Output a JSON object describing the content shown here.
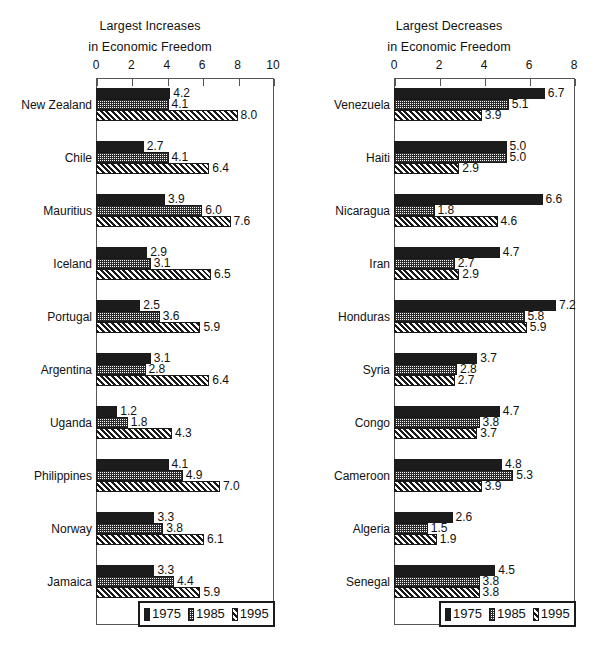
{
  "chart_data": [
    {
      "type": "bar",
      "orientation": "horizontal",
      "title": "Largest Increases",
      "subtitle": "in Economic Freedom",
      "xlabel": "",
      "ylabel": "",
      "xlim": [
        0,
        10
      ],
      "xticks": [
        0,
        2,
        4,
        6,
        8,
        10
      ],
      "grid": false,
      "legend_position": "bottom-right",
      "categories": [
        "New Zealand",
        "Chile",
        "Mauritius",
        "Iceland",
        "Portugal",
        "Argentina",
        "Uganda",
        "Philippines",
        "Norway",
        "Jamaica"
      ],
      "series": [
        {
          "name": "1975",
          "pattern": "solid-black",
          "values": [
            4.2,
            2.7,
            3.9,
            2.9,
            2.5,
            3.1,
            1.2,
            4.1,
            3.3,
            3.3
          ]
        },
        {
          "name": "1985",
          "pattern": "dotted-grid",
          "values": [
            4.1,
            4.1,
            6.0,
            3.1,
            3.6,
            2.8,
            1.8,
            4.9,
            3.8,
            4.4
          ]
        },
        {
          "name": "1995",
          "pattern": "diagonal-hatch",
          "values": [
            8.0,
            6.4,
            7.6,
            6.5,
            5.9,
            6.4,
            4.3,
            7.0,
            6.1,
            5.9
          ]
        }
      ]
    },
    {
      "type": "bar",
      "orientation": "horizontal",
      "title": "Largest Decreases",
      "subtitle": "in Economic Freedom",
      "xlabel": "",
      "ylabel": "",
      "xlim": [
        0,
        8
      ],
      "xticks": [
        0,
        2,
        4,
        6,
        8
      ],
      "grid": false,
      "legend_position": "bottom-right",
      "categories": [
        "Venezuela",
        "Haiti",
        "Nicaragua",
        "Iran",
        "Honduras",
        "Syria",
        "Congo",
        "Cameroon",
        "Algeria",
        "Senegal"
      ],
      "series": [
        {
          "name": "1975",
          "pattern": "solid-black",
          "values": [
            6.7,
            5.0,
            6.6,
            4.7,
            7.2,
            3.7,
            4.7,
            4.8,
            2.6,
            4.5
          ]
        },
        {
          "name": "1985",
          "pattern": "dotted-grid",
          "values": [
            5.1,
            5.0,
            1.8,
            2.7,
            5.8,
            2.8,
            3.8,
            5.3,
            1.5,
            3.8
          ]
        },
        {
          "name": "1995",
          "pattern": "diagonal-hatch",
          "values": [
            3.9,
            2.9,
            4.6,
            2.9,
            5.9,
            2.7,
            3.7,
            3.9,
            1.9,
            3.8
          ]
        }
      ]
    }
  ],
  "legend": {
    "items": [
      {
        "label": "1975",
        "pattern": "p1975"
      },
      {
        "label": "1985",
        "pattern": "p1985"
      },
      {
        "label": "1995",
        "pattern": "p1995"
      }
    ]
  },
  "colors": {
    "ink": "#1a1a1a",
    "axis": "#555555",
    "background": "#ffffff"
  }
}
